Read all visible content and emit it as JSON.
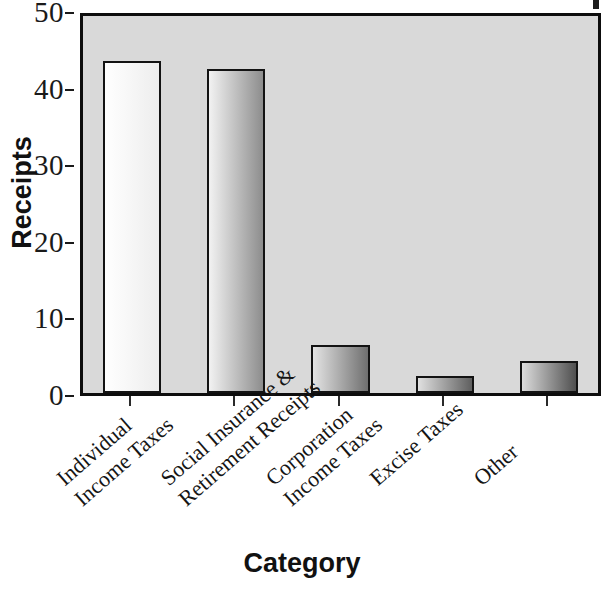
{
  "chart_data": {
    "type": "bar",
    "title": "",
    "xlabel": "Category",
    "ylabel": "Receipts",
    "categories": [
      "Individual Income Taxes",
      "Social Insurance & Retirement Receipts",
      "Corporation Income Taxes",
      "Excise Taxes",
      "Other"
    ],
    "category_lines": [
      [
        "Individual",
        "Income Taxes"
      ],
      [
        "Social Insurance &",
        "Retirement Receipts"
      ],
      [
        "Corporation",
        "Income Taxes"
      ],
      [
        "Excise Taxes",
        ""
      ],
      [
        "Other",
        ""
      ]
    ],
    "values": [
      43.3,
      42.3,
      6.3,
      2.2,
      4.2
    ],
    "ylim": [
      0,
      50
    ],
    "yticks": [
      0,
      10,
      20,
      30,
      40,
      50
    ],
    "ytick_labels": [
      "0",
      "10",
      "20",
      "30",
      "40",
      "50"
    ],
    "grid": false,
    "legend": "none",
    "plot_background": "#d9d9d9",
    "bar_outline_color": "#131313",
    "bar_fills": [
      {
        "from": "#ffffff",
        "to": "#ededed"
      },
      {
        "from": "#f2f2f2",
        "to": "#8d8d8d"
      },
      {
        "from": "#e4e4e4",
        "to": "#6f6f6f"
      },
      {
        "from": "#e0e0e0",
        "to": "#5f5f5f"
      },
      {
        "from": "#dcdcdc",
        "to": "#4f4f4f"
      }
    ]
  }
}
